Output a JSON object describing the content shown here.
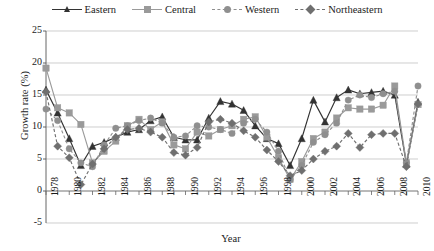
{
  "chart_data": {
    "type": "line",
    "title": "",
    "xlabel": "Year",
    "ylabel": "Growth rate (%)",
    "ylim": [
      -5,
      25
    ],
    "yticks": [
      0,
      5,
      10,
      15,
      20,
      25
    ],
    "ytick_labels": [
      "0",
      "5",
      "10",
      "15",
      "20",
      "25"
    ],
    "grid": true,
    "legend_position": "top-center",
    "x": [
      1978,
      1979,
      1980,
      1981,
      1982,
      1983,
      1984,
      1985,
      1986,
      1987,
      1988,
      1989,
      1990,
      1991,
      1992,
      1993,
      1994,
      1995,
      1996,
      1997,
      1998,
      1999,
      2000,
      2001,
      2002,
      2003,
      2004,
      2005,
      2006,
      2007,
      2008,
      2009,
      2010
    ],
    "xtick_labels": [
      "1978",
      "1980",
      "1982",
      "1984",
      "1986",
      "1988",
      "1990",
      "1992",
      "1994",
      "1996",
      "1998",
      "2000",
      "2002",
      "2004",
      "2006",
      "2008",
      "2010"
    ],
    "series": [
      {
        "name": "Eastern",
        "color": "#333333",
        "dash": "solid",
        "marker": "triangle",
        "values": [
          15.8,
          12.2,
          8.2,
          4.0,
          7.0,
          7.6,
          8.4,
          9.2,
          9.6,
          11.0,
          11.6,
          8.4,
          8.0,
          8.0,
          11.4,
          14.0,
          13.6,
          12.6,
          10.2,
          8.2,
          7.4,
          4.0,
          8.2,
          14.2,
          10.8,
          14.6,
          15.8,
          15.2,
          15.4,
          15.6,
          15.0,
          4.2,
          13.9
        ]
      },
      {
        "name": "Central",
        "color": "#9a9a9a",
        "dash": "solid",
        "marker": "square",
        "values": [
          19.2,
          13.0,
          12.2,
          10.4,
          4.4,
          6.2,
          7.8,
          10.2,
          11.2,
          9.6,
          10.8,
          7.2,
          6.6,
          9.2,
          8.6,
          9.6,
          10.2,
          11.2,
          11.6,
          8.4,
          5.2,
          1.8,
          4.6,
          8.2,
          9.2,
          11.4,
          13.0,
          12.8,
          12.8,
          13.4,
          16.4,
          4.4,
          13.5
        ]
      },
      {
        "name": "Western",
        "color": "#8f8f8f",
        "dash": "dashed",
        "marker": "circle",
        "values": [
          12.8,
          11.0,
          6.6,
          4.4,
          3.8,
          7.2,
          9.8,
          10.2,
          11.0,
          11.4,
          10.6,
          8.4,
          8.6,
          10.2,
          10.0,
          9.6,
          9.0,
          10.6,
          11.2,
          9.2,
          6.2,
          1.8,
          4.0,
          7.6,
          8.8,
          10.6,
          14.2,
          15.0,
          14.6,
          15.2,
          15.6,
          4.4,
          16.4
        ]
      },
      {
        "name": "Northeastern",
        "color": "#6f6f6f",
        "dash": "dashed",
        "marker": "diamond",
        "values": [
          15.5,
          7.0,
          5.2,
          1.0,
          4.2,
          6.6,
          8.4,
          9.6,
          9.8,
          9.2,
          8.4,
          6.0,
          5.6,
          6.8,
          10.8,
          11.2,
          10.6,
          9.4,
          8.4,
          6.4,
          4.6,
          2.4,
          3.2,
          5.0,
          6.2,
          7.0,
          9.0,
          6.8,
          8.8,
          9.0,
          9.0,
          3.8,
          13.6
        ]
      }
    ]
  },
  "legend": {
    "items": [
      {
        "label": "Eastern"
      },
      {
        "label": "Central"
      },
      {
        "label": "Western"
      },
      {
        "label": "Northeastern"
      }
    ]
  }
}
